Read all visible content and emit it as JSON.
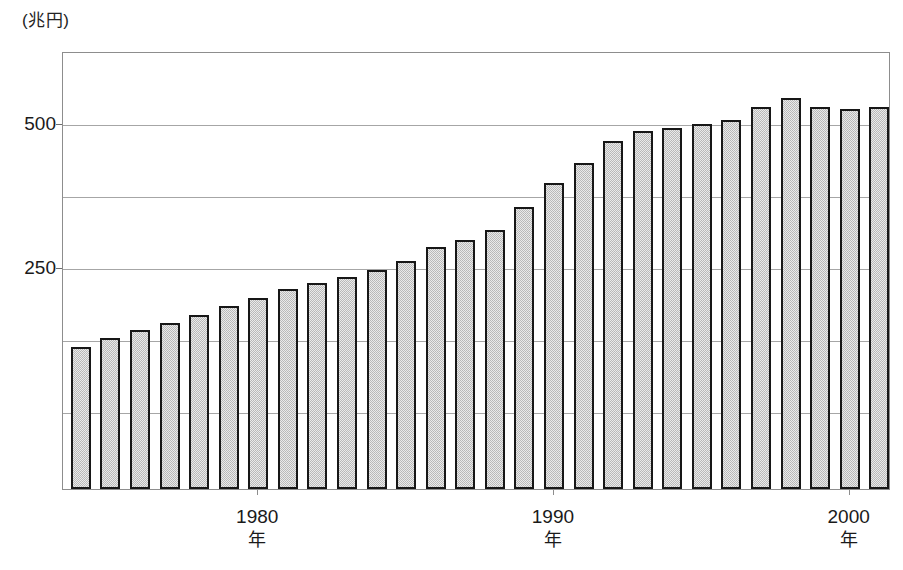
{
  "chart_data": {
    "type": "bar",
    "title": "",
    "subtitle": "",
    "unit_label": "(兆円)",
    "xlabel": "年",
    "ylabel": "",
    "ylim": [
      0,
      573
    ],
    "y_ticks": [
      {
        "value": 500,
        "label": "500"
      },
      {
        "value": 375,
        "label": ""
      },
      {
        "value": 250,
        "label": "250"
      },
      {
        "value": 125,
        "label": ""
      },
      {
        "value": 0,
        "label": ""
      }
    ],
    "y_tick_labels_visible": [
      "500",
      "250"
    ],
    "x_tick_labels": [
      {
        "label": "1980",
        "sublabel": "年",
        "category": "1980"
      },
      {
        "label": "1990",
        "sublabel": "年",
        "category": "1990"
      },
      {
        "label": "2000",
        "sublabel": "年",
        "category": "2000"
      }
    ],
    "grid": true,
    "legend": null,
    "bar_style": {
      "fill": "#c9c9c9",
      "pattern": "checkerboard-hatch",
      "border": "#171717"
    },
    "categories": [
      "1974",
      "1975",
      "1976",
      "1977",
      "1978",
      "1979",
      "1980",
      "1981",
      "1982",
      "1983",
      "1984",
      "1985",
      "1986",
      "1987",
      "1988",
      "1989",
      "1990",
      "1991",
      "1992",
      "1993",
      "1994",
      "1995",
      "1996",
      "1997",
      "1998",
      "1999",
      "2000",
      "2001"
    ],
    "values": [
      112,
      126,
      140,
      152,
      167,
      182,
      196,
      212,
      222,
      233,
      245,
      260,
      284,
      297,
      314,
      355,
      395,
      430,
      468,
      487,
      492,
      498,
      505,
      527,
      543,
      527,
      525,
      527
    ]
  },
  "axes": {
    "y_unit_caption": "(兆円)"
  }
}
